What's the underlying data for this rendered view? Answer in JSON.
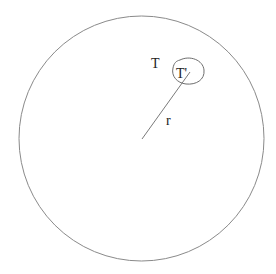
{
  "diagram": {
    "type": "geometric",
    "colors": {
      "stroke": "#8a8a8a",
      "small_loop_stroke": "#6e6e6e",
      "text": "#222222",
      "background": "#ffffff"
    },
    "shapes": {
      "outer_circle": {
        "cx": 141.5,
        "cy": 138.5,
        "r": 122.5
      },
      "radius_line": {
        "x1": 142,
        "y1": 139,
        "x2": 190,
        "y2": 72
      }
    },
    "labels": {
      "outer_region": "T",
      "inner_region": "T'",
      "radius": "r"
    }
  }
}
